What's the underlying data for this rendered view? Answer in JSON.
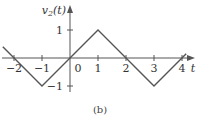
{
  "chart_data": {
    "type": "line",
    "title": "",
    "ylabel": "v2(t)",
    "xlabel": "t",
    "caption": "(b)",
    "x_ticks": [
      -2,
      -1,
      0,
      1,
      2,
      3,
      4
    ],
    "x_tick_labels": [
      "−2",
      "−1",
      "0",
      "1",
      "2",
      "3",
      "4"
    ],
    "y_ticks": [
      1,
      -1
    ],
    "y_tick_labels": [
      "1",
      "−1"
    ],
    "series": [
      {
        "name": "v2(t)",
        "x": [
          -2.4,
          -1,
          0,
          1,
          2,
          3,
          4.15
        ],
        "y": [
          0.4,
          -1,
          0,
          1,
          0,
          -1,
          0.15
        ]
      }
    ],
    "xlim": [
      -2.5,
      4.5
    ],
    "ylim": [
      -1.2,
      1.5
    ],
    "grid": false,
    "line_color": "#555555"
  }
}
